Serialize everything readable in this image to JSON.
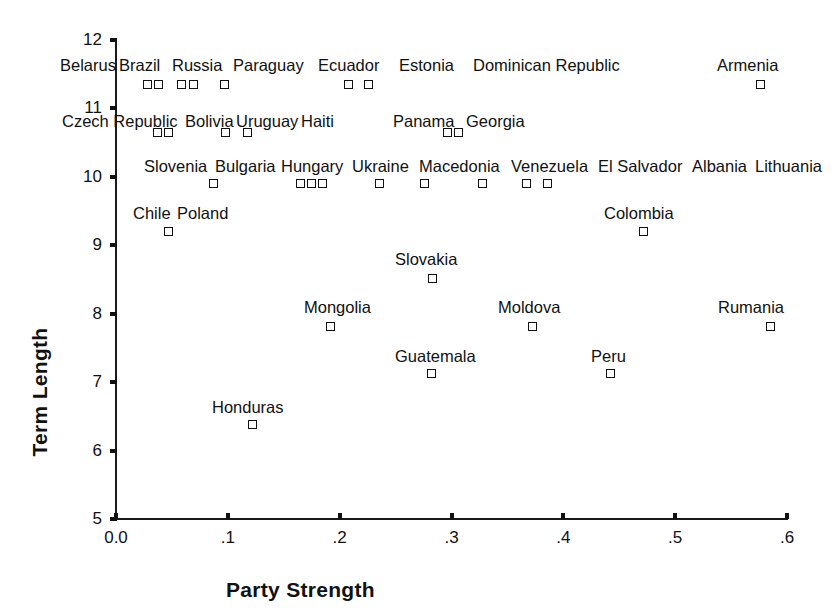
{
  "chart_data": {
    "type": "scatter",
    "title": "",
    "xlabel": "Party Strength",
    "ylabel": "Term Length",
    "xlim": [
      0.0,
      0.6
    ],
    "ylim": [
      5,
      12
    ],
    "xticks": [
      "0.0",
      ".1",
      ".2",
      ".3",
      ".4",
      ".5",
      ".6"
    ],
    "xtick_values": [
      0.0,
      0.1,
      0.2,
      0.3,
      0.4,
      0.5,
      0.6
    ],
    "yticks": [
      "5",
      "6",
      "7",
      "8",
      "9",
      "10",
      "11",
      "12"
    ],
    "ytick_values": [
      5,
      6,
      7,
      8,
      9,
      10,
      11,
      12
    ],
    "grid": false,
    "legend": "none",
    "marker": "open-square",
    "points": [
      {
        "name": "Belarus",
        "x": 0.028,
        "y": 11.35
      },
      {
        "name": "Brazil",
        "x": 0.038,
        "y": 11.35
      },
      {
        "name": "Russia",
        "x": 0.059,
        "y": 11.35
      },
      {
        "name": "Paraguay",
        "x": 0.069,
        "y": 11.35
      },
      {
        "name": "Ecuador",
        "x": 0.097,
        "y": 11.35
      },
      {
        "name": "Estonia",
        "x": 0.208,
        "y": 11.35
      },
      {
        "name": "Dominican Republic",
        "x": 0.226,
        "y": 11.35
      },
      {
        "name": "Armenia",
        "x": 0.576,
        "y": 11.35
      },
      {
        "name": "Czech Republic",
        "x": 0.037,
        "y": 10.65
      },
      {
        "name": "Bolivia",
        "x": 0.047,
        "y": 10.65
      },
      {
        "name": "Uruguay",
        "x": 0.098,
        "y": 10.65
      },
      {
        "name": "Haiti",
        "x": 0.118,
        "y": 10.65
      },
      {
        "name": "Panama",
        "x": 0.296,
        "y": 10.65
      },
      {
        "name": "Georgia",
        "x": 0.306,
        "y": 10.65
      },
      {
        "name": "Slovenia",
        "x": 0.087,
        "y": 9.9
      },
      {
        "name": "Bulgaria",
        "x": 0.165,
        "y": 9.9
      },
      {
        "name": "Hungary",
        "x": 0.175,
        "y": 9.9
      },
      {
        "name": "Ukraine",
        "x": 0.185,
        "y": 9.9
      },
      {
        "name": "Macedonia",
        "x": 0.236,
        "y": 9.9
      },
      {
        "name": "Venezuela",
        "x": 0.276,
        "y": 9.9
      },
      {
        "name": "El Salvador",
        "x": 0.328,
        "y": 9.9
      },
      {
        "name": "Albania",
        "x": 0.367,
        "y": 9.9
      },
      {
        "name": "Lithuania",
        "x": 0.386,
        "y": 9.9
      },
      {
        "name": "Chile",
        "x": 0.047,
        "y": 9.2
      },
      {
        "name": "Poland",
        "x": 0.047,
        "y": 9.2
      },
      {
        "name": "Colombia",
        "x": 0.472,
        "y": 9.2
      },
      {
        "name": "Slovakia",
        "x": 0.283,
        "y": 8.52
      },
      {
        "name": "Mongolia",
        "x": 0.192,
        "y": 7.82
      },
      {
        "name": "Moldova",
        "x": 0.372,
        "y": 7.82
      },
      {
        "name": "Rumania",
        "x": 0.585,
        "y": 7.82
      },
      {
        "name": "Guatemala",
        "x": 0.282,
        "y": 7.12
      },
      {
        "name": "Peru",
        "x": 0.442,
        "y": 7.12
      },
      {
        "name": "Honduras",
        "x": 0.122,
        "y": 6.38
      }
    ],
    "labels": [
      {
        "text": "Belarus",
        "x": 0.0,
        "y": 11.58,
        "align": "left",
        "px": 60,
        "py": 57
      },
      {
        "text": "Brazil",
        "x": 0.0,
        "y": 11.58,
        "align": "left",
        "px": 119,
        "py": 57
      },
      {
        "text": "Russia",
        "x": 0.0,
        "y": 11.58,
        "align": "left",
        "px": 172,
        "py": 57
      },
      {
        "text": "Paraguay",
        "x": 0.0,
        "y": 11.58,
        "align": "left",
        "px": 233,
        "py": 57
      },
      {
        "text": "Ecuador",
        "x": 0.0,
        "y": 11.58,
        "align": "left",
        "px": 318,
        "py": 57
      },
      {
        "text": "Estonia",
        "x": 0.0,
        "y": 11.58,
        "align": "left",
        "px": 399,
        "py": 57
      },
      {
        "text": "Dominican Republic",
        "x": 0.0,
        "y": 11.58,
        "align": "left",
        "px": 473,
        "py": 57
      },
      {
        "text": "Armenia",
        "x": 0.0,
        "y": 11.58,
        "align": "left",
        "px": 717,
        "py": 57
      },
      {
        "text": "Czech Republic",
        "x": 0.0,
        "y": 10.88,
        "align": "left",
        "px": 62,
        "py": 113
      },
      {
        "text": "Bolivia",
        "x": 0.0,
        "y": 10.88,
        "align": "left",
        "px": 185,
        "py": 113
      },
      {
        "text": "Uruguay",
        "x": 0.0,
        "y": 10.88,
        "align": "left",
        "px": 236,
        "py": 113
      },
      {
        "text": "Haiti",
        "x": 0.0,
        "y": 10.88,
        "align": "left",
        "px": 301,
        "py": 113
      },
      {
        "text": "Panama",
        "x": 0.0,
        "y": 10.88,
        "align": "left",
        "px": 393,
        "py": 113
      },
      {
        "text": "Georgia",
        "x": 0.0,
        "y": 10.88,
        "align": "left",
        "px": 466,
        "py": 113
      },
      {
        "text": "Slovenia",
        "x": 0.0,
        "y": 10.15,
        "align": "left",
        "px": 144,
        "py": 158
      },
      {
        "text": "Bulgaria",
        "x": 0.0,
        "y": 10.15,
        "align": "left",
        "px": 215,
        "py": 158
      },
      {
        "text": "Hungary",
        "x": 0.0,
        "y": 10.15,
        "align": "left",
        "px": 281,
        "py": 158
      },
      {
        "text": "Ukraine",
        "x": 0.0,
        "y": 10.15,
        "align": "left",
        "px": 352,
        "py": 158
      },
      {
        "text": "Macedonia",
        "x": 0.0,
        "y": 10.15,
        "align": "left",
        "px": 419,
        "py": 158
      },
      {
        "text": "Venezuela",
        "x": 0.0,
        "y": 10.15,
        "align": "left",
        "px": 511,
        "py": 158
      },
      {
        "text": "El Salvador",
        "x": 0.0,
        "y": 10.15,
        "align": "left",
        "px": 598,
        "py": 158
      },
      {
        "text": "Albania",
        "x": 0.0,
        "y": 10.15,
        "align": "left",
        "px": 692,
        "py": 158
      },
      {
        "text": "Lithuania",
        "x": 0.0,
        "y": 10.15,
        "align": "left",
        "px": 755,
        "py": 158
      },
      {
        "text": "Chile",
        "x": 0.0,
        "y": 9.45,
        "align": "left",
        "px": 133,
        "py": 205
      },
      {
        "text": "Poland",
        "x": 0.0,
        "y": 9.45,
        "align": "left",
        "px": 177,
        "py": 205
      },
      {
        "text": "Colombia",
        "x": 0.0,
        "y": 9.45,
        "align": "left",
        "px": 604,
        "py": 205
      },
      {
        "text": "Slovakia",
        "x": 0.0,
        "y": 8.78,
        "align": "left",
        "px": 395,
        "py": 251
      },
      {
        "text": "Mongolia",
        "x": 0.0,
        "y": 8.08,
        "align": "left",
        "px": 304,
        "py": 299
      },
      {
        "text": "Moldova",
        "x": 0.0,
        "y": 8.08,
        "align": "left",
        "px": 498,
        "py": 299
      },
      {
        "text": "Rumania",
        "x": 0.0,
        "y": 8.08,
        "align": "left",
        "px": 718,
        "py": 299
      },
      {
        "text": "Guatemala",
        "x": 0.0,
        "y": 7.38,
        "align": "left",
        "px": 395,
        "py": 348
      },
      {
        "text": "Peru",
        "x": 0.0,
        "y": 7.38,
        "align": "left",
        "px": 591,
        "py": 348
      },
      {
        "text": "Honduras",
        "x": 0.0,
        "y": 6.64,
        "align": "left",
        "px": 212,
        "py": 399
      }
    ]
  }
}
